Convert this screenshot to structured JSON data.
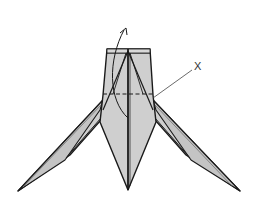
{
  "diagram": {
    "type": "origami-fold-step",
    "labels": {
      "point_label": "X"
    },
    "colors": {
      "paper_fill": "#cfcfcf",
      "paper_shade": "#bdbdbd",
      "line": "#1a1a1a",
      "leader": "#444444",
      "background": "#ffffff"
    },
    "annotations": [
      {
        "kind": "valley-fold-line",
        "style": "dashed",
        "description": "horizontal fold line across body"
      },
      {
        "kind": "fold-arrow",
        "direction": "up",
        "description": "curved arrow lifting lower flap upward"
      },
      {
        "kind": "point-label",
        "text": "X",
        "description": "leader line pointing to right edge at fold line"
      }
    ]
  }
}
